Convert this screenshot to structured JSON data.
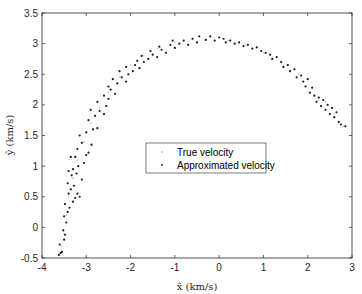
{
  "chart_data": {
    "type": "scatter",
    "title": "",
    "xlabel": "x̂ (km/s)",
    "ylabel": "ŷ (km/s)",
    "xlim": [
      -4,
      3
    ],
    "ylim": [
      -0.5,
      3.5
    ],
    "xticks": [
      -4,
      -3,
      -2,
      -1,
      0,
      1,
      2,
      3
    ],
    "xtick_labels": [
      "-4",
      "-3",
      "-2",
      "-1",
      "0",
      "1",
      "2",
      "3"
    ],
    "yticks": [
      -0.5,
      0,
      0.5,
      1,
      1.5,
      2,
      2.5,
      3,
      3.5
    ],
    "ytick_labels": [
      "-0.5",
      "0",
      "0.5",
      "1",
      "1.5",
      "2",
      "2.5",
      "3",
      "3.5"
    ],
    "grid": false,
    "legend_position": "center",
    "series": [
      {
        "name": "True velocity",
        "color": "#bdbdbd",
        "marker": "dot",
        "points": [
          [
            -3.6,
            -0.45
          ],
          [
            -3.55,
            -0.3
          ],
          [
            -3.5,
            -0.1
          ],
          [
            -3.45,
            0.2
          ],
          [
            -3.4,
            0.5
          ],
          [
            -3.3,
            0.8
          ],
          [
            -3.2,
            1.1
          ],
          [
            -3.05,
            1.4
          ],
          [
            -2.9,
            1.7
          ],
          [
            -2.7,
            1.95
          ],
          [
            -2.5,
            2.2
          ],
          [
            -2.25,
            2.45
          ],
          [
            -2.0,
            2.65
          ],
          [
            -1.7,
            2.8
          ],
          [
            -1.4,
            2.92
          ],
          [
            -1.0,
            3.02
          ],
          [
            -0.6,
            3.08
          ],
          [
            -0.2,
            3.1
          ],
          [
            0.2,
            3.05
          ],
          [
            0.6,
            2.97
          ],
          [
            1.0,
            2.85
          ],
          [
            1.4,
            2.7
          ],
          [
            1.8,
            2.5
          ],
          [
            2.1,
            2.3
          ],
          [
            2.4,
            2.05
          ],
          [
            2.6,
            1.85
          ],
          [
            2.8,
            1.65
          ]
        ]
      },
      {
        "name": "Approximated velocity",
        "color": "#1a1a1a",
        "marker": "dot",
        "points": [
          [
            -3.62,
            -0.45
          ],
          [
            -3.58,
            -0.42
          ],
          [
            -3.55,
            -0.4
          ],
          [
            -3.6,
            -0.28
          ],
          [
            -3.5,
            -0.2
          ],
          [
            -3.48,
            -0.12
          ],
          [
            -3.52,
            -0.05
          ],
          [
            -3.45,
            0.08
          ],
          [
            -3.5,
            0.18
          ],
          [
            -3.42,
            0.25
          ],
          [
            -3.38,
            0.32
          ],
          [
            -3.48,
            0.38
          ],
          [
            -3.3,
            0.42
          ],
          [
            -3.25,
            0.48
          ],
          [
            -3.4,
            0.55
          ],
          [
            -3.35,
            0.62
          ],
          [
            -3.2,
            0.55
          ],
          [
            -3.15,
            0.5
          ],
          [
            -3.28,
            0.68
          ],
          [
            -3.42,
            0.72
          ],
          [
            -3.33,
            0.85
          ],
          [
            -3.22,
            0.88
          ],
          [
            -3.1,
            0.78
          ],
          [
            -3.4,
            0.92
          ],
          [
            -3.3,
            0.95
          ],
          [
            -3.18,
            1.0
          ],
          [
            -3.05,
            1.05
          ],
          [
            -3.35,
            1.15
          ],
          [
            -3.25,
            1.15
          ],
          [
            -3.0,
            1.18
          ],
          [
            -2.95,
            1.22
          ],
          [
            -3.2,
            1.28
          ],
          [
            -2.88,
            1.35
          ],
          [
            -3.1,
            1.38
          ],
          [
            -3.15,
            1.5
          ],
          [
            -3.0,
            1.55
          ],
          [
            -2.85,
            1.6
          ],
          [
            -2.95,
            1.75
          ],
          [
            -2.75,
            1.62
          ],
          [
            -2.8,
            1.82
          ],
          [
            -2.7,
            1.9
          ],
          [
            -2.6,
            1.85
          ],
          [
            -2.9,
            1.92
          ],
          [
            -2.55,
            1.98
          ],
          [
            -2.75,
            2.05
          ],
          [
            -2.5,
            2.1
          ],
          [
            -2.6,
            2.15
          ],
          [
            -2.45,
            2.25
          ],
          [
            -2.35,
            2.18
          ],
          [
            -2.5,
            2.3
          ],
          [
            -2.3,
            2.35
          ],
          [
            -2.4,
            2.42
          ],
          [
            -2.2,
            2.45
          ],
          [
            -2.1,
            2.38
          ],
          [
            -2.25,
            2.55
          ],
          [
            -2.05,
            2.5
          ],
          [
            -1.95,
            2.55
          ],
          [
            -2.1,
            2.62
          ],
          [
            -1.9,
            2.65
          ],
          [
            -1.8,
            2.6
          ],
          [
            -1.85,
            2.72
          ],
          [
            -1.7,
            2.7
          ],
          [
            -1.6,
            2.75
          ],
          [
            -1.75,
            2.8
          ],
          [
            -1.5,
            2.82
          ],
          [
            -1.4,
            2.78
          ],
          [
            -1.55,
            2.88
          ],
          [
            -1.3,
            2.9
          ],
          [
            -1.2,
            2.85
          ],
          [
            -1.35,
            2.95
          ],
          [
            -1.1,
            2.98
          ],
          [
            -1.0,
            2.93
          ],
          [
            -0.9,
            3.0
          ],
          [
            -1.05,
            3.05
          ],
          [
            -0.8,
            3.05
          ],
          [
            -0.7,
            2.98
          ],
          [
            -0.6,
            3.08
          ],
          [
            -0.5,
            3.02
          ],
          [
            -0.45,
            3.12
          ],
          [
            -0.3,
            3.06
          ],
          [
            -0.2,
            3.12
          ],
          [
            -0.1,
            3.05
          ],
          [
            0.0,
            3.1
          ],
          [
            0.1,
            3.08
          ],
          [
            0.15,
            3.02
          ],
          [
            0.25,
            3.05
          ],
          [
            0.35,
            3.0
          ],
          [
            0.45,
            3.02
          ],
          [
            0.55,
            2.96
          ],
          [
            0.65,
            2.98
          ],
          [
            0.75,
            2.92
          ],
          [
            0.85,
            2.94
          ],
          [
            0.95,
            2.88
          ],
          [
            1.05,
            2.85
          ],
          [
            1.15,
            2.82
          ],
          [
            1.2,
            2.75
          ],
          [
            1.3,
            2.78
          ],
          [
            1.4,
            2.7
          ],
          [
            1.45,
            2.62
          ],
          [
            1.55,
            2.65
          ],
          [
            1.6,
            2.55
          ],
          [
            1.7,
            2.58
          ],
          [
            1.75,
            2.45
          ],
          [
            1.85,
            2.48
          ],
          [
            1.9,
            2.38
          ],
          [
            1.95,
            2.3
          ],
          [
            2.0,
            2.42
          ],
          [
            2.05,
            2.2
          ],
          [
            2.1,
            2.28
          ],
          [
            2.15,
            2.15
          ],
          [
            2.2,
            2.05
          ],
          [
            2.25,
            2.12
          ],
          [
            2.3,
            1.98
          ],
          [
            2.35,
            2.08
          ],
          [
            2.4,
            1.92
          ],
          [
            2.45,
            2.0
          ],
          [
            2.5,
            1.85
          ],
          [
            2.55,
            1.95
          ],
          [
            2.6,
            1.8
          ],
          [
            2.65,
            1.88
          ],
          [
            2.7,
            1.72
          ],
          [
            2.75,
            1.68
          ],
          [
            2.85,
            1.65
          ]
        ]
      }
    ]
  },
  "legend": {
    "items": [
      {
        "label": "True velocity"
      },
      {
        "label": "Approximated velocity"
      }
    ]
  }
}
